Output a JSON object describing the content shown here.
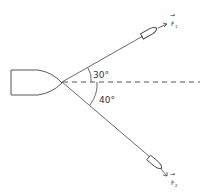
{
  "diagram": {
    "angles": {
      "upper": "30°",
      "lower": "40°"
    },
    "forces": {
      "upper": {
        "vector": "→",
        "label": "F",
        "subscript": "1"
      },
      "lower": {
        "vector": "→",
        "label": "F",
        "subscript": "2"
      }
    },
    "colors": {
      "line": "#333333",
      "background": "#ffffff"
    }
  }
}
